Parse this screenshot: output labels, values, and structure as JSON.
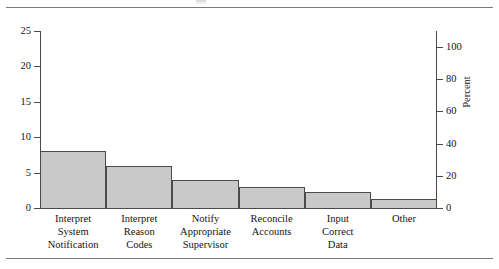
{
  "figure": {
    "top_rule": "horizontal-rule",
    "bottom_rule": "horizontal-rule"
  },
  "chart_data": {
    "type": "bar",
    "title": "",
    "xlabel": "",
    "ylabel": "",
    "categories": [
      "Interpret System Notification",
      "Interpret Reason Codes",
      "Notify Appropriate Supervisor",
      "Reconcile Accounts",
      "Input Correct Data",
      "Other"
    ],
    "category_lines": [
      [
        "Interpret",
        "System",
        "Notification"
      ],
      [
        "Interpret",
        "Reason",
        "Codes"
      ],
      [
        "Notify",
        "Appropriate",
        "Supervisor"
      ],
      [
        "Reconcile",
        "Accounts"
      ],
      [
        "Input",
        "Correct",
        "Data"
      ],
      [
        "Other"
      ]
    ],
    "values": [
      8,
      6,
      4,
      3,
      2.2,
      1.3
    ],
    "ylim": [
      0,
      25
    ],
    "yticks": [
      0,
      5,
      10,
      15,
      20,
      25
    ],
    "ytick_labels": [
      "0",
      "5",
      "10",
      "15",
      "20",
      "25"
    ],
    "y2lim": [
      0,
      110
    ],
    "y2ticks": [
      0,
      20,
      40,
      60,
      80,
      100
    ],
    "y2tick_labels": [
      "0",
      "20",
      "40",
      "60",
      "80",
      "100"
    ],
    "y2label": "Percent",
    "grid": false,
    "legend": null,
    "bar_fill": "#c9c9c9",
    "bar_edge": "#4b4b4b",
    "axis_color": "#4a4a4a"
  }
}
